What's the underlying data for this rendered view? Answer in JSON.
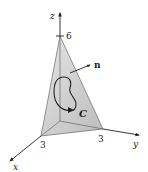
{
  "figure": {
    "type": "3d-surface-diagram",
    "axes": {
      "x": {
        "label": "x",
        "tick_label": "3"
      },
      "y": {
        "label": "y",
        "tick_label": "3"
      },
      "z": {
        "label": "z",
        "tick_label": "6"
      }
    },
    "surface": {
      "description": "triangular plane through intercepts (3,0,0), (0,3,0), (0,0,6)"
    },
    "normal_vector": {
      "label": "n"
    },
    "curve": {
      "label": "C",
      "orientation": "counterclockwise"
    },
    "colors": {
      "face": "#c8c8c8",
      "face_light": "#e6e6e6",
      "side_left": "#d9d9d9",
      "side_back": "#ececec",
      "lines": "#333333"
    }
  }
}
